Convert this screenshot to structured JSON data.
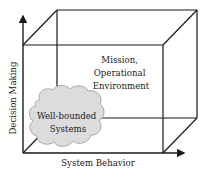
{
  "diagram": {
    "axes": {
      "y_label": "Decision Making",
      "x_label": "System Behavior"
    },
    "regions": {
      "outer": {
        "line1": "Mission,",
        "line2": "Operational",
        "line3": "Environment"
      },
      "inner": {
        "line1": "Well-bounded",
        "line2": "Systems"
      }
    },
    "colors": {
      "line": "#1a1a1a",
      "cloud_fill": "#dcdcdc",
      "cloud_stroke": "#9a9a9a",
      "text": "#222222"
    }
  }
}
